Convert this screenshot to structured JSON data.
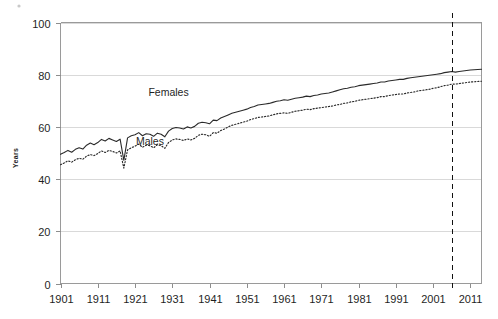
{
  "chart_data": {
    "type": "line",
    "title": "",
    "xlabel": "",
    "ylabel": "Years",
    "xlim": [
      1901,
      2014
    ],
    "ylim": [
      0,
      100
    ],
    "grid": true,
    "legend_position": "inline-annotations",
    "x_ticks": [
      1901,
      1911,
      1921,
      1931,
      1941,
      1951,
      1961,
      1971,
      1981,
      1991,
      2001,
      2011
    ],
    "y_ticks": [
      0,
      20,
      40,
      60,
      80,
      100
    ],
    "annotations": [
      {
        "text": "Females",
        "x": 1930,
        "y": 72
      },
      {
        "text": "Males",
        "x": 1925,
        "y": 53
      }
    ],
    "reference_line": {
      "orientation": "vertical",
      "x": 2006,
      "style": "dashed"
    },
    "x": [
      1901,
      1902,
      1903,
      1904,
      1905,
      1906,
      1907,
      1908,
      1909,
      1910,
      1911,
      1912,
      1913,
      1914,
      1915,
      1916,
      1917,
      1918,
      1919,
      1920,
      1921,
      1922,
      1923,
      1924,
      1925,
      1926,
      1927,
      1928,
      1929,
      1930,
      1931,
      1932,
      1933,
      1934,
      1935,
      1936,
      1937,
      1938,
      1939,
      1940,
      1941,
      1942,
      1943,
      1944,
      1945,
      1946,
      1947,
      1948,
      1949,
      1950,
      1951,
      1952,
      1953,
      1954,
      1955,
      1956,
      1957,
      1958,
      1959,
      1960,
      1961,
      1962,
      1963,
      1964,
      1965,
      1966,
      1967,
      1968,
      1969,
      1970,
      1971,
      1972,
      1973,
      1974,
      1975,
      1976,
      1977,
      1978,
      1979,
      1980,
      1981,
      1982,
      1983,
      1984,
      1985,
      1986,
      1987,
      1988,
      1989,
      1990,
      1991,
      1992,
      1993,
      1994,
      1995,
      1996,
      1997,
      1998,
      1999,
      2000,
      2001,
      2002,
      2003,
      2004,
      2005,
      2006,
      2007,
      2008,
      2009,
      2010,
      2011,
      2012,
      2013,
      2014
    ],
    "series": [
      {
        "name": "Females",
        "style": "solid",
        "values": [
          49.5,
          50.2,
          51.0,
          50.3,
          51.4,
          52.0,
          51.5,
          53.0,
          53.8,
          53.2,
          54.0,
          55.2,
          54.6,
          55.6,
          55.0,
          54.4,
          55.3,
          47.2,
          55.8,
          56.6,
          57.0,
          57.8,
          56.6,
          57.4,
          57.2,
          56.4,
          57.6,
          57.2,
          56.2,
          58.4,
          59.4,
          59.8,
          59.6,
          59.2,
          60.0,
          59.6,
          60.2,
          61.4,
          61.8,
          61.6,
          61.2,
          62.6,
          62.4,
          63.4,
          64.0,
          64.6,
          65.2,
          65.6,
          66.0,
          66.4,
          66.8,
          67.4,
          67.8,
          68.4,
          68.6,
          68.8,
          69.0,
          69.4,
          69.8,
          70.0,
          70.4,
          70.2,
          70.6,
          71.0,
          71.2,
          71.4,
          71.8,
          71.6,
          72.0,
          72.2,
          72.6,
          72.8,
          73.0,
          73.4,
          73.8,
          74.2,
          74.6,
          74.8,
          75.2,
          75.4,
          75.8,
          76.0,
          76.2,
          76.4,
          76.6,
          76.8,
          77.2,
          77.2,
          77.6,
          77.8,
          78.0,
          78.2,
          78.2,
          78.6,
          78.8,
          79.0,
          79.2,
          79.4,
          79.6,
          79.8,
          80.0,
          80.2,
          80.4,
          80.8,
          81.0,
          81.2,
          81.0,
          81.2,
          81.4,
          81.6,
          81.8,
          81.9,
          82.0,
          82.1
        ]
      },
      {
        "name": "Males",
        "style": "dotted",
        "values": [
          45.5,
          46.2,
          47.0,
          46.5,
          47.4,
          48.0,
          47.6,
          48.8,
          49.4,
          49.0,
          49.8,
          50.8,
          50.2,
          51.0,
          50.6,
          50.0,
          50.8,
          44.2,
          51.2,
          52.0,
          52.6,
          53.4,
          52.2,
          53.0,
          52.8,
          52.0,
          53.2,
          52.8,
          51.8,
          54.0,
          55.0,
          55.4,
          55.2,
          54.8,
          55.4,
          55.0,
          55.6,
          56.8,
          57.2,
          57.0,
          56.4,
          57.8,
          57.6,
          58.6,
          59.2,
          60.0,
          60.6,
          61.0,
          61.4,
          61.8,
          62.2,
          62.8,
          63.2,
          63.6,
          63.8,
          64.0,
          64.2,
          64.6,
          65.0,
          65.2,
          65.4,
          65.2,
          65.6,
          66.0,
          66.2,
          66.4,
          66.8,
          66.6,
          67.0,
          67.2,
          67.4,
          67.6,
          67.8,
          68.0,
          68.4,
          68.6,
          69.0,
          69.2,
          69.6,
          69.8,
          70.2,
          70.4,
          70.6,
          70.8,
          71.0,
          71.2,
          71.6,
          71.6,
          72.0,
          72.2,
          72.4,
          72.6,
          72.6,
          73.0,
          73.2,
          73.4,
          73.8,
          74.0,
          74.2,
          74.4,
          74.8,
          75.0,
          75.4,
          75.8,
          76.0,
          76.4,
          76.4,
          76.6,
          76.8,
          77.0,
          77.2,
          77.3,
          77.4,
          77.5
        ]
      }
    ]
  },
  "axis": {
    "y_title": "Years",
    "y_tick_labels": [
      "100",
      "80",
      "60",
      "40",
      "20",
      "0"
    ],
    "x_tick_labels": [
      "1901",
      "1911",
      "1921",
      "1931",
      "1941",
      "1951",
      "1961",
      "1971",
      "1981",
      "1991",
      "2001",
      "2011"
    ]
  },
  "labels": {
    "females": "Females",
    "males": "Males"
  },
  "colors": {
    "series_line": "#2a2a2a",
    "grid": "#d9d9d9",
    "frame": "#9a9a9a",
    "marker": "#111111",
    "text": "#1f1f1f",
    "background": "#ffffff"
  }
}
